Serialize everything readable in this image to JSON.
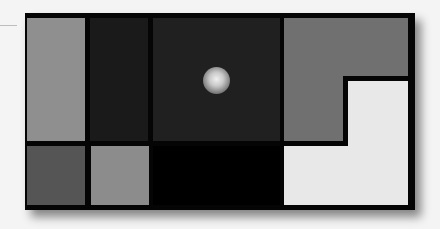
{
  "figure": {
    "colors": {
      "background": "#f4f4f4",
      "frame": "#050505",
      "left_tall_panel": "#8f8f8f",
      "dark_column": "#1a1a1a",
      "center_panel": "#202020",
      "right_gray": "#707070",
      "right_white": "#e8e8e8",
      "bottom_left_dark_gray": "#555555",
      "bottom_mid_gray": "#8c8c8c",
      "bottom_center_black": "#000000"
    },
    "sphere": {
      "shape": "glowing-sphere",
      "highlight": "#e6e6e6"
    }
  }
}
